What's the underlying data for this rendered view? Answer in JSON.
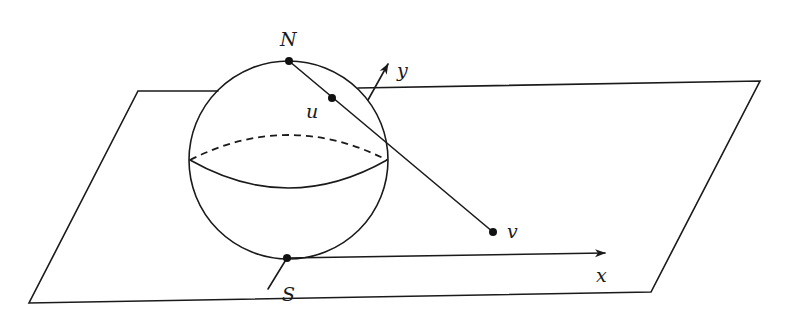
{
  "figure": {
    "labels": {
      "north_pole": "N",
      "south_pole": "S",
      "sphere_point": "u",
      "plane_point": "v",
      "x_axis": "x",
      "y_axis": "y"
    },
    "colors": {
      "stroke": "#1a1a1a",
      "background": "#ffffff"
    }
  }
}
